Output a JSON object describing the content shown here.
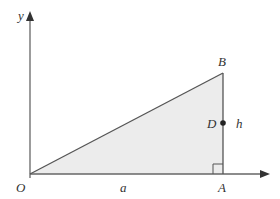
{
  "diagram": {
    "type": "right-triangle-on-axes",
    "axes": {
      "x_label": "",
      "y_label": "y"
    },
    "points": {
      "origin": "O",
      "top_vertex": "B",
      "foot": "A",
      "midpoint": "D"
    },
    "segment_labels": {
      "base": "a",
      "height": "h"
    },
    "colors": {
      "fill": "#ececec",
      "stroke": "#555555",
      "axis": "#666666",
      "text": "#333333"
    }
  }
}
